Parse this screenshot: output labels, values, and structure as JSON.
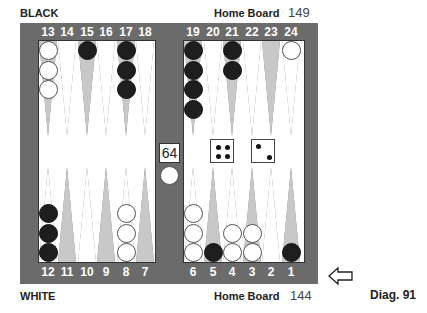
{
  "header": {
    "top_player": "BLACK",
    "top_home_label": "Home Board",
    "top_pip_count": "149",
    "bottom_player": "WHITE",
    "bottom_home_label": "Home Board",
    "bottom_pip_count": "144",
    "diagram_label": "Diag. 91"
  },
  "board": {
    "top_points": [
      "13",
      "14",
      "15",
      "16",
      "17",
      "18",
      "19",
      "20",
      "21",
      "22",
      "23",
      "24"
    ],
    "bottom_points": [
      "12",
      "11",
      "10",
      "9",
      "8",
      "7",
      "6",
      "5",
      "4",
      "3",
      "2",
      "1"
    ],
    "positions": {
      "13": {
        "color": "white",
        "count": 3
      },
      "15": {
        "color": "black",
        "count": 1
      },
      "17": {
        "color": "black",
        "count": 3
      },
      "19": {
        "color": "black",
        "count": 4
      },
      "21": {
        "color": "black",
        "count": 2
      },
      "24": {
        "color": "white",
        "count": 1
      },
      "12": {
        "color": "black",
        "count": 3
      },
      "8": {
        "color": "white",
        "count": 3
      },
      "6": {
        "color": "white",
        "count": 3
      },
      "5": {
        "color": "black",
        "count": 1
      },
      "4": {
        "color": "white",
        "count": 2
      },
      "3": {
        "color": "white",
        "count": 2
      },
      "1": {
        "color": "black",
        "count": 1
      }
    },
    "bar": {
      "white": 1,
      "black": 0
    },
    "cube_value": "64",
    "dice": [
      4,
      2
    ],
    "turn_indicator": "arrow-left-icon"
  },
  "colors": {
    "frame": "#6b6b6b",
    "field": "#ffffff",
    "point_dark": "#c8c8c8",
    "point_light": "#ffffff",
    "checker_black": "#1e1e1e",
    "checker_white": "#ffffff"
  }
}
